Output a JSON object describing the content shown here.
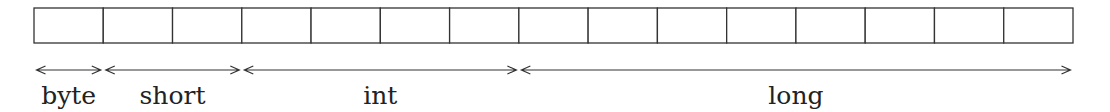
{
  "diagram": {
    "title": "",
    "total_cells": 15,
    "segments": [
      {
        "label": "byte",
        "start_cell": 0,
        "cells": 1
      },
      {
        "label": "short",
        "start_cell": 1,
        "cells": 2
      },
      {
        "label": "int",
        "start_cell": 3,
        "cells": 4
      },
      {
        "label": "long",
        "start_cell": 7,
        "cells": 8
      }
    ],
    "colors": {
      "stroke": "#333333",
      "text": "#222222",
      "background": "#ffffff"
    }
  }
}
